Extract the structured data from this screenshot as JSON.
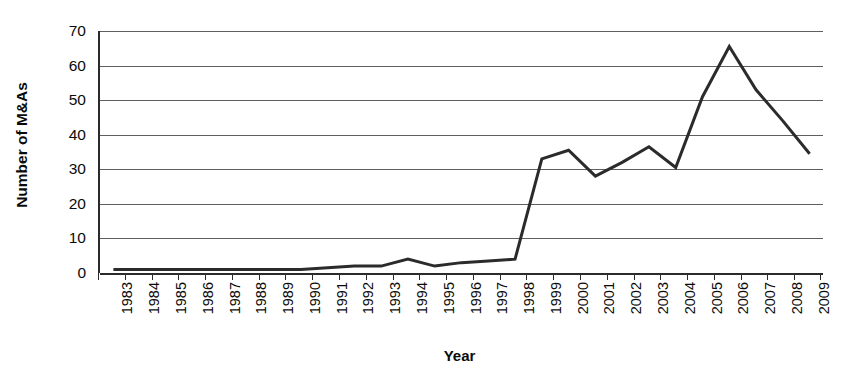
{
  "chart_data": {
    "type": "line",
    "title": "",
    "xlabel": "Year",
    "ylabel": "Number of M&As",
    "categories": [
      "1983",
      "1984",
      "1985",
      "1986",
      "1987",
      "1988",
      "1989",
      "1990",
      "1991",
      "1992",
      "1993",
      "1994",
      "1995",
      "1996",
      "1997",
      "1998",
      "1999",
      "2000",
      "2001",
      "2002",
      "2003",
      "2004",
      "2005",
      "2006",
      "2007",
      "2008",
      "2009"
    ],
    "values": [
      1,
      1,
      1,
      1,
      1,
      1,
      1,
      1,
      1.5,
      2,
      2,
      4,
      2,
      3,
      3.5,
      4,
      33,
      35.5,
      28,
      32,
      36.5,
      30.5,
      51,
      65.5,
      53,
      44,
      34.5
    ],
    "series": [
      {
        "name": "Number of M&As",
        "values": [
          1,
          1,
          1,
          1,
          1,
          1,
          1,
          1,
          1.5,
          2,
          2,
          4,
          2,
          3,
          3.5,
          4,
          33,
          35.5,
          28,
          32,
          36.5,
          30.5,
          51,
          65.5,
          53,
          44,
          34.5
        ]
      }
    ],
    "ylim": [
      0,
      70
    ],
    "ytick_labels": [
      "0",
      "10",
      "20",
      "30",
      "40",
      "50",
      "60",
      "70"
    ],
    "ytick_values": [
      0,
      10,
      20,
      30,
      40,
      50,
      60,
      70
    ],
    "grid": true,
    "legend": "none",
    "line_color": "#2b2b2b",
    "axis_color": "#2b2b2b",
    "gridline_color": "#5f5f5f",
    "background_color": "#ffffff"
  }
}
